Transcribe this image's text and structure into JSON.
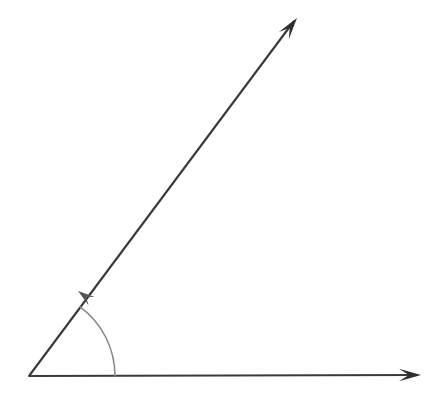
{
  "figure": {
    "name": "angle-diagram",
    "type": "geometry-diagram",
    "background_color": "#ffffff",
    "width": 437,
    "height": 401
  },
  "geometry": {
    "vertex": {
      "label": "vertex",
      "x": 29,
      "y": 376
    },
    "rays": [
      {
        "name": "horizontal-ray",
        "description": "initial side pointing right",
        "from_x": 29,
        "from_y": 376,
        "to_x": 418,
        "to_y": 375,
        "angle_degrees": 0,
        "color": "#3a3a3a",
        "stroke_width": 2.1,
        "arrowhead": "end"
      },
      {
        "name": "slanted-ray",
        "description": "terminal side pointing up and to the right",
        "from_x": 29,
        "from_y": 376,
        "to_x": 294,
        "to_y": 21,
        "angle_degrees": 53,
        "color": "#3a3a3a",
        "stroke_width": 2.1,
        "arrowhead": "end"
      }
    ],
    "arc": {
      "name": "angle-arc",
      "description": "curved arrow from horizontal ray to slanted ray indicating the measured angle",
      "start_x": 113,
      "start_y": 376,
      "end_x": 80,
      "end_y": 293,
      "radius": 86,
      "sweep_degrees": 53,
      "direction": "counterclockwise",
      "color": "#8a8a8a",
      "stroke_width": 1.6,
      "arrowhead": "end"
    },
    "arrowheads": [
      {
        "name": "horizontal-ray-arrowhead",
        "tip_x": 421,
        "tip_y": 375,
        "color": "#2e2e2e"
      },
      {
        "name": "slanted-ray-arrowhead",
        "tip_x": 297,
        "tip_y": 18,
        "color": "#2e2e2e"
      },
      {
        "name": "angle-arc-arrowhead",
        "tip_x": 78,
        "tip_y": 291,
        "color": "#555555"
      }
    ]
  },
  "chart_data": {
    "type": "diagram",
    "elements": [
      {
        "kind": "ray",
        "label": "horizontal ray (initial side)",
        "angle_degrees": 0,
        "length_px": 392
      },
      {
        "kind": "ray",
        "label": "slanted ray (terminal side)",
        "angle_degrees": 53,
        "length_px": 444
      },
      {
        "kind": "arc",
        "label": "angle arc with arrow",
        "measure_degrees": 53,
        "radius_px": 86
      }
    ],
    "annotations": [],
    "legend": [],
    "grid": false
  }
}
